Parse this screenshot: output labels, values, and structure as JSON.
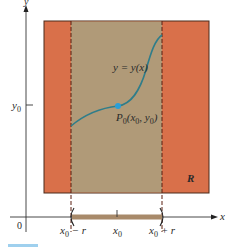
{
  "diagram": {
    "colors": {
      "outer_region": "#d9704a",
      "inner_strip": "#b09a78",
      "curve": "#2f7d8a",
      "point": "#2a9fd8",
      "dashed": "#5a1e10",
      "axis": "#333333",
      "interval_bar": "#a88a6a"
    },
    "axes": {
      "x_label": "x",
      "y_label": "y",
      "origin_label": "0"
    },
    "labels": {
      "y0_tick": "y",
      "y0_sub": "0",
      "curve_label": "y = y(x)",
      "point_label_main": "P",
      "point_label_sub": "0",
      "point_label_coords_open": "(x",
      "point_label_coords_sub1": "0",
      "point_label_coords_mid": ", y",
      "point_label_coords_sub2": "0",
      "point_label_coords_close": ")",
      "region_label": "R",
      "x0_minus_r_base": "x",
      "x0_minus_r_sub": "0",
      "x0_minus_r_tail": " − r",
      "x0_base": "x",
      "x0_sub": "0",
      "x0_plus_r_base": "x",
      "x0_plus_r_sub": "0",
      "x0_plus_r_tail": " + r"
    }
  }
}
